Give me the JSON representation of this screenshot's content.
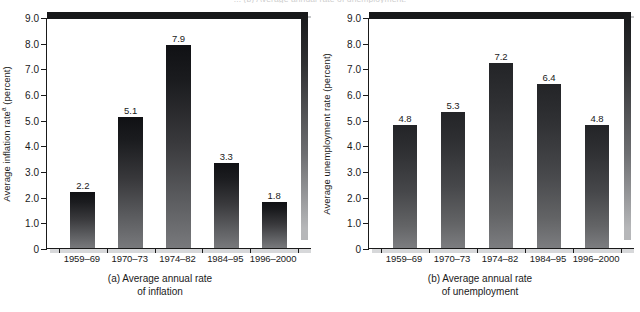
{
  "top_caption": "... (b) Average annual rate of unemployment.",
  "chart_data": [
    {
      "type": "bar",
      "panel_id": "a",
      "title": "",
      "caption_line1": "(a) Average annual rate",
      "caption_line2": "of inflation",
      "xlabel": "",
      "ylabel": "Average inflation rate",
      "ylabel_sup": "a",
      "ylabel_units": " (percent)",
      "categories": [
        "1959–69",
        "1970–73",
        "1974–82",
        "1984–95",
        "1996–2000"
      ],
      "values": [
        2.2,
        5.1,
        7.9,
        3.3,
        1.8
      ],
      "value_labels": [
        "2.2",
        "5.1",
        "7.9",
        "3.3",
        "1.8"
      ],
      "ylim": [
        0,
        9.0
      ],
      "yticks": [
        0,
        1.0,
        2.0,
        3.0,
        4.0,
        5.0,
        6.0,
        7.0,
        8.0,
        9.0
      ],
      "ytick_labels": [
        "0",
        "1.0",
        "2.0",
        "3.0",
        "4.0",
        "5.0",
        "6.0",
        "7.0",
        "8.0",
        "9.0"
      ],
      "grid": false,
      "legend": null,
      "bar_color": "#39393c"
    },
    {
      "type": "bar",
      "panel_id": "b",
      "title": "",
      "caption_line1": "(b) Average annual rate",
      "caption_line2": "of unemployment",
      "xlabel": "",
      "ylabel": "Average unemployment rate",
      "ylabel_sup": "",
      "ylabel_units": " (percent)",
      "categories": [
        "1959–69",
        "1970–73",
        "1974–82",
        "1984–95",
        "1996–2000"
      ],
      "values": [
        4.8,
        5.3,
        7.2,
        6.4,
        4.8
      ],
      "value_labels": [
        "4.8",
        "5.3",
        "7.2",
        "6.4",
        "4.8"
      ],
      "ylim": [
        0,
        9.0
      ],
      "yticks": [
        0,
        1.0,
        2.0,
        3.0,
        4.0,
        5.0,
        6.0,
        7.0,
        8.0,
        9.0
      ],
      "ytick_labels": [
        "0",
        "1.0",
        "2.0",
        "3.0",
        "4.0",
        "5.0",
        "6.0",
        "7.0",
        "8.0",
        "9.0"
      ],
      "grid": false,
      "legend": null,
      "bar_color": "#47484b"
    }
  ]
}
